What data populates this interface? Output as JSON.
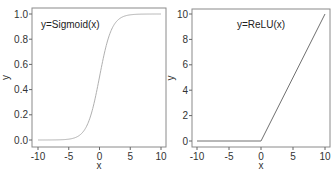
{
  "chart_data": [
    {
      "type": "line",
      "title": "",
      "annotation": "y=Sigmoid(x)",
      "xlabel": "x",
      "ylabel": "y",
      "xlim": [
        -10,
        10
      ],
      "ylim": [
        0,
        1
      ],
      "xticks": [
        "-10",
        "-5",
        "0",
        "5",
        "10"
      ],
      "yticks": [
        "0.0",
        "0.2",
        "0.4",
        "0.6",
        "0.8",
        "1.0"
      ],
      "function": "sigmoid",
      "x": [
        -10,
        -5,
        -4,
        -3,
        -2,
        -1,
        0,
        1,
        2,
        3,
        4,
        5,
        10
      ],
      "y": [
        0.0,
        0.007,
        0.018,
        0.047,
        0.119,
        0.269,
        0.5,
        0.731,
        0.881,
        0.953,
        0.982,
        0.993,
        1.0
      ],
      "grid": false,
      "line_color": "#b0b0b0"
    },
    {
      "type": "line",
      "title": "",
      "annotation": "y=ReLU(x)",
      "xlabel": "x",
      "ylabel": "y",
      "xlim": [
        -10,
        10
      ],
      "ylim": [
        0,
        10
      ],
      "xticks": [
        "-10",
        "-5",
        "0",
        "5",
        "10"
      ],
      "yticks": [
        "0",
        "2",
        "4",
        "6",
        "8",
        "10"
      ],
      "function": "relu",
      "x": [
        -10,
        0,
        10
      ],
      "y": [
        0,
        0,
        10
      ],
      "grid": false,
      "line_color": "#707070"
    }
  ]
}
